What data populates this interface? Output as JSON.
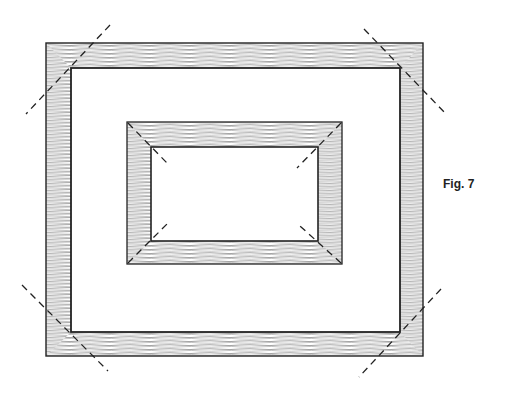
{
  "figure": {
    "caption": "Fig. 7",
    "colors": {
      "line": "#222222",
      "hatch": "#555555",
      "background": "#ffffff"
    },
    "outer_frame": {
      "outer": [
        46,
        43,
        423,
        356
      ],
      "inner": [
        71,
        68,
        400,
        332
      ]
    },
    "inner_frame": {
      "outer": [
        127,
        122,
        342,
        264
      ],
      "inner": [
        151,
        147,
        318,
        241
      ]
    }
  }
}
